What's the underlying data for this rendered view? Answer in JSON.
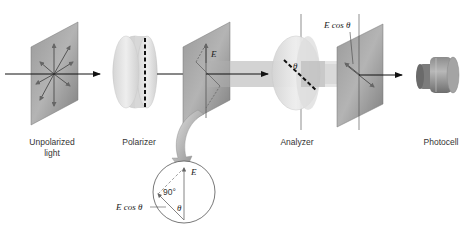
{
  "diagram": {
    "labels": {
      "unpolarized_line1": "Unpolarized",
      "unpolarized_line2": "light",
      "polarizer": "Polarizer",
      "analyzer": "Analyzer",
      "photocell": "Photocell"
    },
    "annotations": {
      "field_E": "E",
      "theta": "θ",
      "e_cos_theta_top": "E cos θ",
      "inset_E": "E",
      "inset_angle": "90°",
      "inset_theta": "θ",
      "inset_e_cos_theta": "E cos θ"
    },
    "colors": {
      "plate": "#8a8a8a",
      "plate_light": "#a8a8a8",
      "disk": "#e2e2e2",
      "beam": "#cfcfcf",
      "arrow": "#111111",
      "curve_arrow": "#8f8f8f",
      "text": "#333333"
    }
  }
}
